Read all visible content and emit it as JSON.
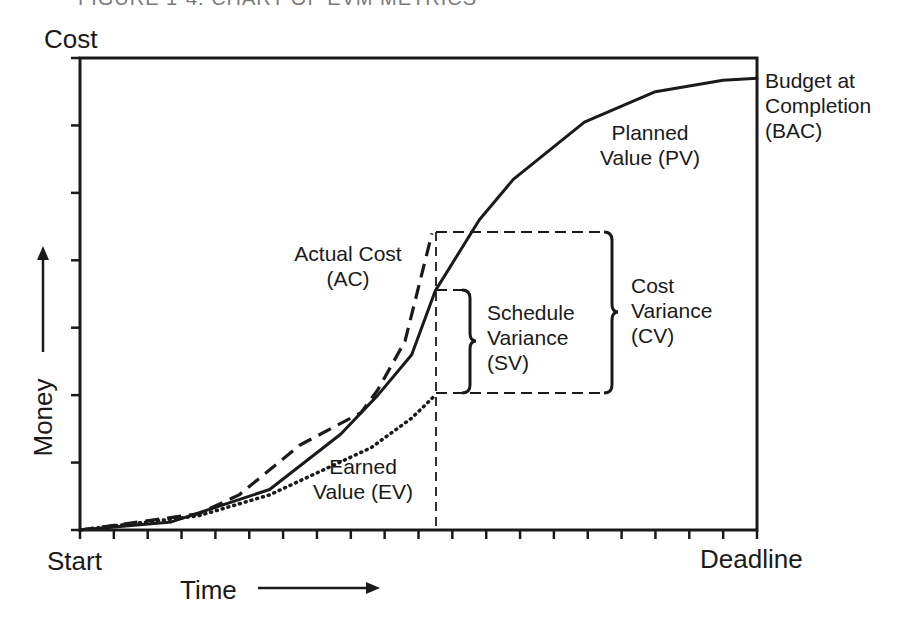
{
  "caption": "FIGURE 1-4: CHART OF EVM METRICS",
  "labels": {
    "y_top": "Cost",
    "y_axis": "Money",
    "x_start": "Start",
    "x_end": "Deadline",
    "x_axis": "Time",
    "bac": [
      "Budget at",
      "Completion",
      "(BAC)"
    ],
    "pv": [
      "Planned",
      "Value (PV)"
    ],
    "ac": [
      "Actual Cost",
      "(AC)"
    ],
    "ev": [
      "Earned",
      "Value (EV)"
    ],
    "sv": [
      "Schedule",
      "Variance",
      "(SV)"
    ],
    "cv": [
      "Cost",
      "Variance",
      "(CV)"
    ]
  },
  "chart_data": {
    "type": "line",
    "title": "Chart of EVM Metrics",
    "xlabel": "Time",
    "ylabel": "Money",
    "x_range_labels": [
      "Start",
      "Deadline"
    ],
    "x_ticks": 21,
    "y_ticks": 8,
    "xlim": [
      0,
      20
    ],
    "ylim": [
      0,
      7
    ],
    "grid": false,
    "status_date_x": 10.5,
    "series": [
      {
        "name": "Planned Value (PV)",
        "style": "solid",
        "points": [
          [
            0,
            0
          ],
          [
            2.7,
            0.12
          ],
          [
            5.6,
            0.6
          ],
          [
            7.7,
            1.42
          ],
          [
            8.8,
            2.0
          ],
          [
            9.8,
            2.6
          ],
          [
            10.5,
            3.55
          ],
          [
            11.8,
            4.6
          ],
          [
            12.8,
            5.2
          ],
          [
            14.9,
            6.05
          ],
          [
            17,
            6.5
          ],
          [
            19,
            6.67
          ],
          [
            20,
            6.7
          ]
        ]
      },
      {
        "name": "Actual Cost (AC)",
        "style": "dashed",
        "points": [
          [
            0,
            0
          ],
          [
            3.5,
            0.24
          ],
          [
            4.7,
            0.52
          ],
          [
            6.5,
            1.26
          ],
          [
            8.3,
            1.74
          ],
          [
            8.8,
            2.08
          ],
          [
            9.6,
            2.8
          ],
          [
            10.4,
            4.4
          ]
        ]
      },
      {
        "name": "Earned Value (EV)",
        "style": "dotted",
        "points": [
          [
            0,
            0
          ],
          [
            3.5,
            0.21
          ],
          [
            5.6,
            0.52
          ],
          [
            8.6,
            1.22
          ],
          [
            9.8,
            1.66
          ],
          [
            10.5,
            2.0
          ]
        ]
      }
    ],
    "annotations": [
      {
        "text": "Budget at Completion (BAC)",
        "at": [
          20,
          6.7
        ]
      },
      {
        "text": "Schedule Variance (SV)",
        "from": 2.0,
        "to": 3.55,
        "x": 10.5
      },
      {
        "text": "Cost Variance (CV)",
        "from": 2.0,
        "to": 4.4,
        "x": 10.5
      }
    ]
  },
  "colors": {
    "line": "#1a1a1a",
    "background": "#ffffff",
    "caption": "#7a7a7a"
  }
}
